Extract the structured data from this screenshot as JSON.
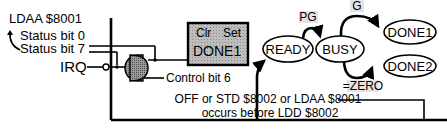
{
  "labels": {
    "ldaa": "LDAA $8001",
    "status_bit_0": "Status bit 0",
    "status_bit_7": "Status bit 7",
    "irq": "IRQ",
    "control_bit_6": "Control bit 6"
  },
  "register_box": {
    "clr": "Clr",
    "set": "Set",
    "name": "DONE1",
    "fill": "#c8c8c8"
  },
  "states": {
    "ready": "READY",
    "busy": "BUSY",
    "done1": "DONE1",
    "done2": "DONE2"
  },
  "transitions": {
    "pg": "PG",
    "g": "G",
    "zero": "=ZERO"
  },
  "reset_note": {
    "line1": "OFF or STD $8002 or LDAA $8001",
    "line2": "occurs before LDD $8002"
  },
  "icons": {
    "and_gate": "and-gate-icon",
    "inverter_bubble": "inverter-bubble-icon"
  }
}
